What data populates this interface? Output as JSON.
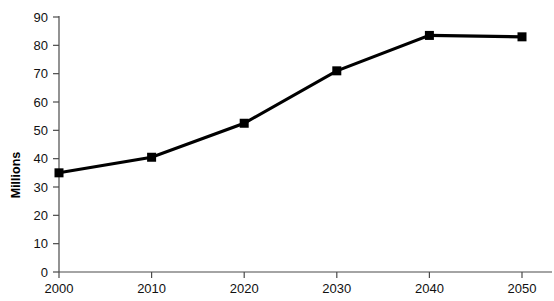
{
  "chart_data": {
    "type": "line",
    "title": "",
    "xlabel": "",
    "ylabel": "Millions",
    "categories": [
      "2000",
      "2010",
      "2020",
      "2030",
      "2040",
      "2050"
    ],
    "x": [
      2000,
      2010,
      2020,
      2030,
      2040,
      2050
    ],
    "values": [
      35,
      40.5,
      52.5,
      71,
      83.5,
      83
    ],
    "xlim": [
      2000,
      2050
    ],
    "ylim": [
      0,
      90
    ],
    "ytick_labels": [
      "0",
      "10",
      "20",
      "30",
      "40",
      "50",
      "60",
      "70",
      "80",
      "90"
    ],
    "ytick_values": [
      0,
      10,
      20,
      30,
      40,
      50,
      60,
      70,
      80,
      90
    ],
    "xtick_labels": [
      "2000",
      "2010",
      "2020",
      "2030",
      "2040",
      "2050"
    ],
    "grid": false,
    "legend": "none",
    "marker": "square",
    "series_color": "#000000",
    "axis_color": "#4a4a4a",
    "background_color": "#ffffff"
  }
}
